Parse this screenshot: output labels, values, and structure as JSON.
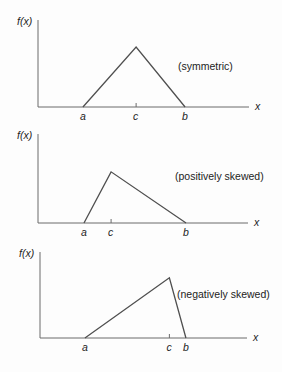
{
  "figure": {
    "description_labels": [
      "(symmetric)",
      "(positively skewed)",
      "(negatively skewed)"
    ]
  },
  "colors": {
    "axis_line": "#6b6b6b",
    "curve_line": "#4f4f4f",
    "text": "#1c1c1c",
    "background": "#fdfdfd"
  },
  "chart_data": [
    {
      "type": "line",
      "subtype": "triangular-density-sketch",
      "annotation": "(symmetric)",
      "ylabel": "f(x)",
      "xlabel": "x",
      "x_ticks": [
        "a",
        "c",
        "b"
      ],
      "vertices_rel": {
        "a": 0.213,
        "c": 0.465,
        "b": 0.697
      },
      "peak_at": "c",
      "peak_rel_height": 0.69,
      "grid": false,
      "legend": false
    },
    {
      "type": "line",
      "subtype": "triangular-density-sketch",
      "annotation": "(positively skewed)",
      "ylabel": "f(x)",
      "xlabel": "x",
      "x_ticks": [
        "a",
        "c",
        "b"
      ],
      "vertices_rel": {
        "a": 0.219,
        "c": 0.348,
        "b": 0.705
      },
      "peak_at": "c",
      "peak_rel_height": 0.575,
      "grid": false,
      "legend": false
    },
    {
      "type": "line",
      "subtype": "triangular-density-sketch",
      "annotation": "(negatively skewed)",
      "ylabel": "f(x)",
      "xlabel": "x",
      "x_ticks": [
        "a",
        "c",
        "b"
      ],
      "vertices_rel": {
        "a": 0.217,
        "c": 0.625,
        "b": 0.705
      },
      "peak_at": "c",
      "peak_rel_height": 0.7,
      "grid": false,
      "legend": false
    }
  ]
}
